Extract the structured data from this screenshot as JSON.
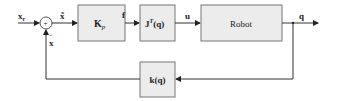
{
  "diagram": {
    "type": "control-block-diagram",
    "signals": {
      "input": "x",
      "input_sub": "r",
      "error": "x̃",
      "force": "f",
      "torque": "u",
      "output": "q",
      "feedback": "x",
      "feedback_sign": "−",
      "sum_sign": "+"
    },
    "blocks": {
      "gain": {
        "label": "K",
        "sub": "p"
      },
      "jacobian": {
        "label": "J",
        "sup": "T",
        "arg": "(q)"
      },
      "robot": {
        "label": "Robot"
      },
      "kinematics": {
        "label": "k",
        "arg": "(q)"
      }
    },
    "colors": {
      "block_fill": "#ececec",
      "block_stroke": "#777777",
      "line": "#333333"
    }
  }
}
